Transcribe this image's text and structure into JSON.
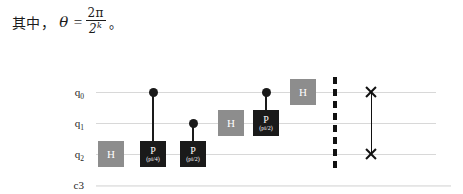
{
  "caption": {
    "prefix": "其中",
    "comma": "，",
    "symbol": "θ",
    "equals": "=",
    "numerator": "2π",
    "denominator_base": "2",
    "denominator_exp": "k",
    "period": "。"
  },
  "circuit": {
    "registers": [
      {
        "name": "q0",
        "label_base": "q",
        "label_sub": "0",
        "type": "quantum"
      },
      {
        "name": "q1",
        "label_base": "q",
        "label_sub": "1",
        "type": "quantum"
      },
      {
        "name": "q2",
        "label_base": "q",
        "label_sub": "2",
        "type": "quantum"
      },
      {
        "name": "c3",
        "label_base": "c3",
        "label_sub": "",
        "type": "classical"
      }
    ],
    "gates": [
      {
        "id": "h-q2",
        "type": "H",
        "label": "H",
        "param": "",
        "qubit": "q2",
        "color": "#8d8d8d"
      },
      {
        "id": "cp-q0-q2",
        "type": "P",
        "label": "P",
        "param": "(pi/4)",
        "qubit": "q2",
        "control": "q0",
        "color": "#1a1a1a"
      },
      {
        "id": "cp-q1-q2",
        "type": "P",
        "label": "P",
        "param": "(pi/2)",
        "qubit": "q2",
        "control": "q1",
        "color": "#1a1a1a"
      },
      {
        "id": "h-q1",
        "type": "H",
        "label": "H",
        "param": "",
        "qubit": "q1",
        "color": "#8d8d8d"
      },
      {
        "id": "cp-q0-q1",
        "type": "P",
        "label": "P",
        "param": "(pi/2)",
        "qubit": "q1",
        "control": "q0",
        "color": "#1a1a1a"
      },
      {
        "id": "h-q0",
        "type": "H",
        "label": "H",
        "param": "",
        "qubit": "q0",
        "color": "#8d8d8d"
      }
    ],
    "barrier": {
      "id": "barrier-1",
      "label": "barrier"
    },
    "swap": {
      "id": "swap-q0-q2",
      "label": "swap",
      "qubits": [
        "q0",
        "q2"
      ]
    }
  }
}
